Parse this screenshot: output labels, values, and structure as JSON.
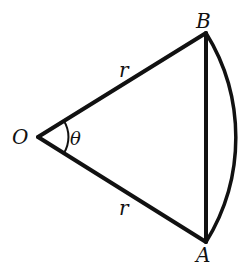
{
  "diagram": {
    "type": "circular-sector-with-chord",
    "stroke_color": "#111111",
    "background": "#ffffff",
    "points": {
      "O": {
        "label": "O",
        "x": 38,
        "y": 137
      },
      "B": {
        "label": "B",
        "x": 206,
        "y": 33
      },
      "A": {
        "label": "A",
        "x": 206,
        "y": 242
      }
    },
    "labels": {
      "O": "O",
      "A": "A",
      "B": "B",
      "radius_upper": "r",
      "radius_lower": "r",
      "angle": "θ"
    },
    "segments": [
      {
        "from": "O",
        "to": "B",
        "label": "r"
      },
      {
        "from": "O",
        "to": "A",
        "label": "r"
      },
      {
        "from": "A",
        "to": "B",
        "label": ""
      }
    ],
    "arc": {
      "from": "A",
      "to": "B",
      "center": "O",
      "bulge_x": 235
    },
    "angle_mark": {
      "vertex": "O",
      "label": "θ"
    }
  }
}
